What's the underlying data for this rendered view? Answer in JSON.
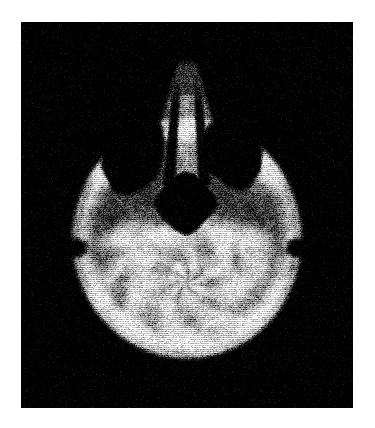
{
  "page": {
    "background_color": "#ffffff",
    "width": 375,
    "height": 428
  },
  "film": {
    "label": "axial-head-scan",
    "background_color": "#050505",
    "x": 21,
    "y": 22,
    "width": 332,
    "height": 386,
    "modality_appearance": "grayscale axial cross-sectional head image, halftone/dithered print texture",
    "orientation": "axial, anterior (nose) at top, posterior (occiput) at bottom"
  },
  "scan": {
    "head_outline": {
      "center_x": 187,
      "center_y": 248,
      "half_width": 116,
      "top_y": 118,
      "bottom_y": 360
    },
    "nose": {
      "tip_y": 58,
      "base_y": 140,
      "half_width_tip": 10,
      "half_width_base": 34,
      "center_x": 187
    },
    "nasal_septum": {
      "center_x": 187,
      "top_y": 70,
      "bottom_y": 185,
      "width": 5
    },
    "dark_cavities": [
      {
        "name": "left-sinus-cavity",
        "cx": 134,
        "cy": 156,
        "rx": 30,
        "ry": 38
      },
      {
        "name": "right-sinus-cavity",
        "cx": 232,
        "cy": 152,
        "rx": 29,
        "ry": 36
      },
      {
        "name": "central-sphenoid-cavity",
        "cx": 186,
        "cy": 203,
        "rx": 32,
        "ry": 31
      }
    ],
    "ear_notches": [
      {
        "name": "left-ear-notch",
        "cx": 76,
        "cy": 248,
        "rx": 13,
        "ry": 11
      },
      {
        "name": "right-ear-notch",
        "cx": 297,
        "cy": 248,
        "rx": 12,
        "ry": 11
      }
    ],
    "brain_region": {
      "name": "posterior-fossa-cerebellum",
      "cx": 187,
      "cy": 282,
      "rx": 108,
      "ry": 82
    },
    "texture": {
      "type": "horizontal-line-dither",
      "line_period": 2,
      "noise_amount": 0.3
    },
    "tone": {
      "background": "#000000",
      "soft_tissue_mid": "#6e6e6e",
      "bone_bright": "#e8e8e8",
      "cavity_dark": "#000000"
    }
  }
}
